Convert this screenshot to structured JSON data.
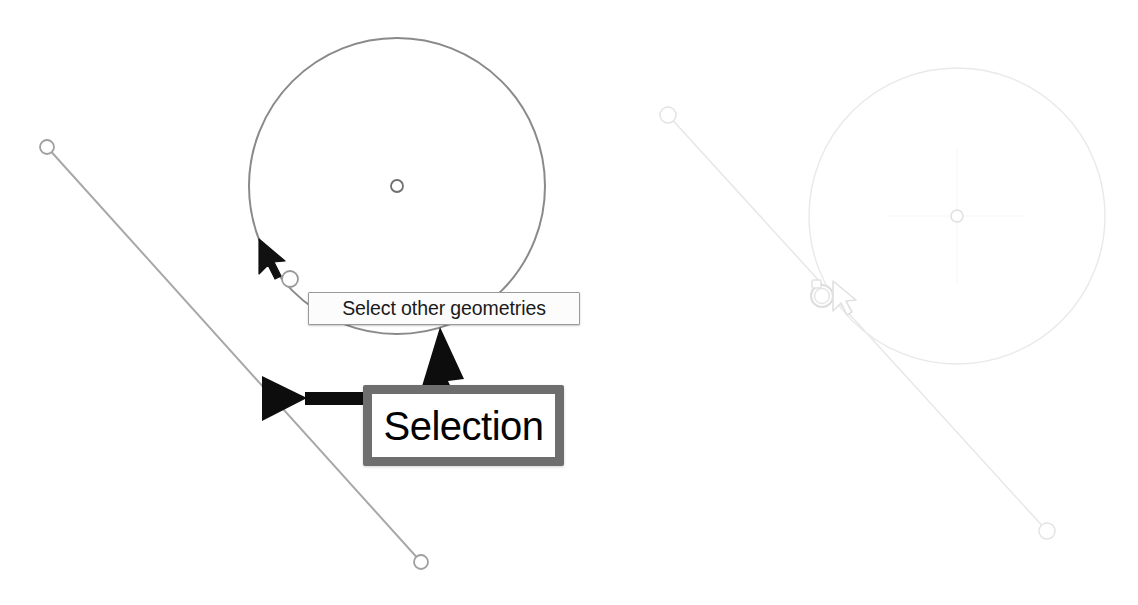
{
  "app": {
    "kind": "cad-sketch-canvas",
    "background_color": "#ffffff",
    "width": 1138,
    "height": 605
  },
  "tooltip": {
    "label": "Select other geometries",
    "background_color": "#fcfcfc",
    "border_color": "#9a9a9a",
    "text_color": "#1a1a1a"
  },
  "callout": {
    "label": "Selection",
    "border_color": "#6e6e6e",
    "fill_color": "#ffffff",
    "text_color": "#000000"
  },
  "annotations": {
    "arrow_to_line": {
      "name": "left-arrow-to-line",
      "direction": "left",
      "color": "#0d0d0d"
    },
    "arrow_to_circle": {
      "name": "up-arrow-to-circle",
      "direction": "up-left",
      "color": "#0d0d0d"
    }
  },
  "panels": [
    {
      "id": "before",
      "name": "active-sketch-panel",
      "stroke_color": "#8c8c8c",
      "opacity": "1.0",
      "cursor": {
        "name": "select-other-cursor",
        "x": 259,
        "y": 240,
        "color": "#101010"
      },
      "geometries": [
        {
          "type": "line",
          "name": "sketch-line",
          "x1": 47,
          "y1": 147,
          "x2": 421,
          "y2": 562
        },
        {
          "type": "circle",
          "name": "sketch-circle",
          "cx": 397,
          "cy": 186,
          "r": 148
        }
      ],
      "vertices": [
        {
          "name": "line-start-vertex",
          "x": 47,
          "y": 147,
          "r": 7
        },
        {
          "name": "line-end-vertex",
          "x": 421,
          "y": 562,
          "r": 7
        },
        {
          "name": "circle-center-vertex",
          "x": 397,
          "y": 186,
          "r": 6
        },
        {
          "name": "intersection-vertex",
          "x": 290,
          "y": 279,
          "r": 8
        }
      ]
    },
    {
      "id": "after",
      "name": "ghost-sketch-panel",
      "stroke_color": "#d8d8d8",
      "opacity": "0.45",
      "cursor": {
        "name": "select-other-ring-cursor",
        "x": 818,
        "y": 288,
        "color": "#c9c9c9"
      },
      "geometries": [
        {
          "type": "line",
          "name": "sketch-line",
          "x1": 668,
          "y1": 115,
          "x2": 1047,
          "y2": 531
        },
        {
          "type": "circle",
          "name": "sketch-circle",
          "cx": 957,
          "cy": 216,
          "r": 148
        }
      ],
      "vertices": [
        {
          "name": "line-start-vertex",
          "x": 668,
          "y": 115,
          "r": 8
        },
        {
          "name": "line-end-vertex",
          "x": 1047,
          "y": 531,
          "r": 8
        },
        {
          "name": "circle-center-vertex",
          "x": 957,
          "y": 216,
          "r": 6
        },
        {
          "name": "intersection-vertex",
          "x": 822,
          "y": 296,
          "r": 11
        }
      ]
    }
  ]
}
